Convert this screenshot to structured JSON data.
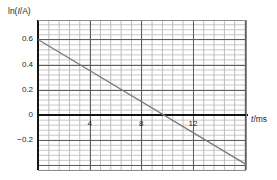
{
  "chart_data": {
    "type": "line",
    "title": "",
    "subtitle": "",
    "xlabel": "t/ms",
    "ylabel": "ln(I/A)",
    "xlabel_parts": {
      "symbol": "t",
      "unit": "/ms"
    },
    "ylabel_parts": {
      "prefix": "ln(",
      "symbol": "I",
      "suffix": "/A)"
    },
    "grid": true,
    "grid_style": "graph-paper",
    "minor_grid_step_x": 0.8,
    "minor_grid_step_y": 0.04,
    "major_grid_step_x": 4,
    "major_grid_step_y": 0.2,
    "legend": "none",
    "xlim": [
      0,
      16.1
    ],
    "ylim": [
      -0.44,
      0.755
    ],
    "xticks": [
      4,
      8,
      12
    ],
    "xtick_labels": [
      "4",
      "8",
      "12"
    ],
    "yticks": [
      0.6,
      0.4,
      0.2,
      0,
      -0.2
    ],
    "ytick_labels": [
      "0.6",
      "0.4",
      "0.2",
      "0",
      "−0.2"
    ],
    "series": [
      {
        "name": "ln(I/A) vs t",
        "type": "line",
        "color": "#7a7a7a",
        "x": [
          0,
          16.1
        ],
        "y": [
          0.6,
          -0.395
        ],
        "intercept": 0.6,
        "slope": -0.0618,
        "x_intercept": 9.7
      }
    ],
    "annotations": []
  },
  "axes": {
    "zero_axis_label": "0",
    "x_axis_title": "t/ms",
    "y_axis_title": "ln(I/A)"
  }
}
